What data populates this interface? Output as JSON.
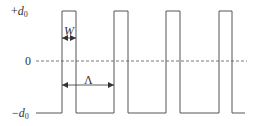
{
  "diagram": {
    "type": "square-pulse-train",
    "y_labels": {
      "top": {
        "prefix": "+",
        "symbol": "d",
        "subscript": "0"
      },
      "zero": "0",
      "bottom": {
        "prefix": "−",
        "symbol": "d",
        "subscript": "0"
      }
    },
    "width_label": "W",
    "period_label": "Λ",
    "pulses": [
      {
        "x_start": 62,
        "x_end": 76
      },
      {
        "x_start": 114,
        "x_end": 128
      },
      {
        "x_start": 166,
        "x_end": 180
      },
      {
        "x_start": 219,
        "x_end": 232
      }
    ],
    "levels": {
      "top_y": 11,
      "zero_y": 61,
      "bottom_y": 113
    },
    "baseline": {
      "x_start": 36,
      "x_end": 245
    },
    "zero_line": {
      "x_start": 36,
      "x_end": 247,
      "style": "dashed"
    },
    "colors": {
      "line": "#555555",
      "text": "#333333"
    }
  }
}
